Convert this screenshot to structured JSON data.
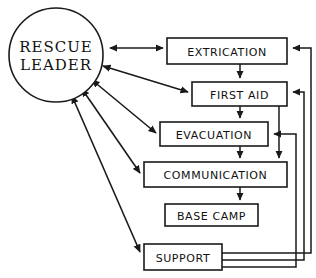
{
  "diagram": {
    "style": {
      "stroke_color": "#1a1a1a",
      "fill_color": "#ffffff",
      "background": "#ffffff"
    },
    "hub": {
      "id": "rescue-leader",
      "line1": "RESCUE",
      "line2": "LEADER",
      "shape": "circle",
      "cx": 56,
      "cy": 55,
      "r": 48
    },
    "nodes": [
      {
        "id": "extrication",
        "label": "EXTRICATION",
        "x": 167,
        "y": 38,
        "w": 120,
        "h": 26,
        "font_size": 11
      },
      {
        "id": "first-aid",
        "label": "FIRST AID",
        "x": 192,
        "y": 82,
        "w": 95,
        "h": 24,
        "font_size": 11
      },
      {
        "id": "evacuation",
        "label": "EVACUATION",
        "x": 160,
        "y": 122,
        "w": 108,
        "h": 24,
        "font_size": 11
      },
      {
        "id": "communication",
        "label": "COMMUNICATION",
        "x": 144,
        "y": 162,
        "w": 143,
        "h": 25,
        "font_size": 11
      },
      {
        "id": "base-camp",
        "label": "BASE CAMP",
        "x": 165,
        "y": 204,
        "w": 93,
        "h": 22,
        "font_size": 11
      },
      {
        "id": "support",
        "label": "SUPPORT",
        "x": 144,
        "y": 244,
        "w": 78,
        "h": 26,
        "font_size": 11
      }
    ],
    "edges": [
      {
        "id": "leader-extrication",
        "from": "rescue-leader",
        "to": "extrication",
        "type": "bidirectional",
        "shape": "horizontal"
      },
      {
        "id": "leader-first-aid",
        "from": "rescue-leader",
        "to": "first-aid",
        "type": "bidirectional",
        "shape": "diagonal"
      },
      {
        "id": "leader-evacuation",
        "from": "rescue-leader",
        "to": "evacuation",
        "type": "bidirectional",
        "shape": "diagonal"
      },
      {
        "id": "leader-communication",
        "from": "rescue-leader",
        "to": "communication",
        "type": "bidirectional",
        "shape": "diagonal"
      },
      {
        "id": "leader-support",
        "from": "rescue-leader",
        "to": "support",
        "type": "bidirectional",
        "shape": "diagonal"
      },
      {
        "id": "extrication-first-aid",
        "from": "extrication",
        "to": "first-aid",
        "type": "directed",
        "shape": "vertical"
      },
      {
        "id": "first-aid-evacuation",
        "from": "first-aid",
        "to": "evacuation",
        "type": "directed",
        "shape": "vertical"
      },
      {
        "id": "evacuation-communication",
        "from": "evacuation",
        "to": "communication",
        "type": "directed",
        "shape": "vertical"
      },
      {
        "id": "communication-base-camp",
        "from": "communication",
        "to": "base-camp",
        "type": "directed",
        "shape": "vertical"
      },
      {
        "id": "first-aid-communication",
        "from": "first-aid",
        "to": "communication",
        "type": "directed",
        "shape": "elbow-right"
      },
      {
        "id": "support-extrication",
        "from": "support",
        "to": "extrication",
        "type": "directed",
        "shape": "feedback-outer"
      },
      {
        "id": "support-first-aid",
        "from": "support",
        "to": "first-aid",
        "type": "directed",
        "shape": "feedback-middle"
      },
      {
        "id": "support-evacuation",
        "from": "support",
        "to": "evacuation",
        "type": "directed",
        "shape": "feedback-inner"
      }
    ]
  }
}
